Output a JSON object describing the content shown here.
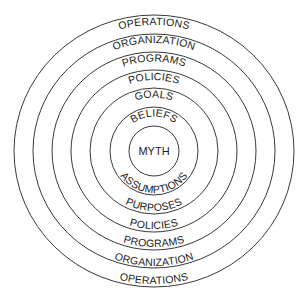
{
  "diagram": {
    "type": "concentric-rings",
    "center": {
      "x": 154,
      "y": 151
    },
    "colors": {
      "stroke": "#3a3a3a",
      "text": "#222222",
      "background": "#ffffff"
    },
    "core": {
      "label": "MYTH"
    },
    "rings": [
      {
        "index": 1,
        "top_label": "BELIEFS",
        "bottom_label": "ASSUMPTIONS"
      },
      {
        "index": 2,
        "top_label": "GOALS",
        "bottom_label": "PURPOSES"
      },
      {
        "index": 3,
        "top_label": "POLICIES",
        "bottom_label": "POLICIES"
      },
      {
        "index": 4,
        "top_label": "PROGRAMS",
        "bottom_label": "PROGRAMS"
      },
      {
        "index": 5,
        "top_label": "ORGANIZATION",
        "bottom_label": "ORGANIZATION"
      },
      {
        "index": 6,
        "top_label": "OPERATIONS",
        "bottom_label": "OPERATIONS"
      }
    ]
  }
}
